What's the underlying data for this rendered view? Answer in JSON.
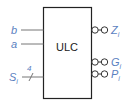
{
  "block": {
    "label": "ULC"
  },
  "inputs": [
    {
      "name": "b",
      "subscript": ""
    },
    {
      "name": "a",
      "subscript": ""
    },
    {
      "name": "S",
      "subscript": "i",
      "bus_width": "4"
    }
  ],
  "outputs": [
    {
      "name": "Z",
      "subscript": "i"
    },
    {
      "name": "G",
      "subscript": "i"
    },
    {
      "name": "P",
      "subscript": "i"
    }
  ],
  "colors": {
    "label": "#5b7fbf",
    "line": "#555555",
    "box": "#222222"
  }
}
